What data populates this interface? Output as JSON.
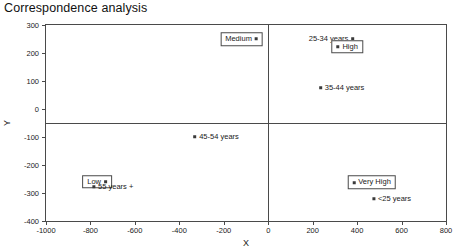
{
  "chart_data": {
    "type": "scatter",
    "title": "Correspondence analysis",
    "xlabel": "X",
    "ylabel": "Y",
    "xlim": [
      -1000,
      800
    ],
    "ylim": [
      -400,
      300
    ],
    "grid": false,
    "legend": "none",
    "xticks": [
      -1000,
      -800,
      -600,
      -400,
      -200,
      0,
      200,
      400,
      600,
      800
    ],
    "yticks": [
      300,
      200,
      100,
      0,
      -100,
      -200,
      -300,
      -400
    ],
    "xtick_labels": [
      "-1000",
      "-800",
      "-600",
      "-400",
      "-200",
      "0",
      "200",
      "400",
      "600",
      "800"
    ],
    "ytick_labels": [
      "300",
      "200",
      "100",
      "0",
      "-100",
      "-200",
      "-300",
      "-400"
    ],
    "origin_lines": {
      "x": 0,
      "y": -50
    },
    "points": [
      {
        "label": "Medium",
        "x": -120,
        "y": 250,
        "boxed": true,
        "label_side": "left",
        "group": "income"
      },
      {
        "label": "25-34 years",
        "x": 285,
        "y": 250,
        "boxed": false,
        "label_side": "left",
        "group": "age"
      },
      {
        "label": "High",
        "x": 355,
        "y": 222,
        "boxed": true,
        "label_side": "right",
        "group": "income"
      },
      {
        "label": "35-44 years",
        "x": 330,
        "y": 75,
        "boxed": false,
        "label_side": "right",
        "group": "age"
      },
      {
        "label": "45-54 years",
        "x": -235,
        "y": -100,
        "boxed": false,
        "label_side": "right",
        "group": "age"
      },
      {
        "label": "Low",
        "x": -770,
        "y": -260,
        "boxed": true,
        "label_side": "left",
        "group": "income"
      },
      {
        "label": "55 years +",
        "x": -700,
        "y": -278,
        "boxed": false,
        "label_side": "right",
        "group": "age"
      },
      {
        "label": "Very High",
        "x": 465,
        "y": -262,
        "boxed": true,
        "label_side": "right",
        "group": "income"
      },
      {
        "label": "<25 years",
        "x": 555,
        "y": -320,
        "boxed": false,
        "label_side": "right",
        "group": "age"
      }
    ]
  }
}
